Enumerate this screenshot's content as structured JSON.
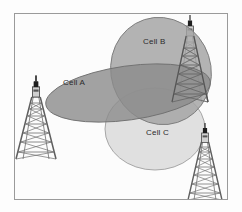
{
  "figure": {
    "background_color": "#fdfdfd",
    "frame_color": "#9a9a9a",
    "label_color": "#2b2b2b"
  },
  "cells": [
    {
      "id": "cell-a",
      "label": "Cell A",
      "fill": "#8e8e8e",
      "stroke": "#6f6f6f",
      "cx": 128,
      "cy": 93,
      "rx": 83,
      "ry": 27,
      "rotate": -8,
      "label_x": 63,
      "label_y": 79
    },
    {
      "id": "cell-b",
      "label": "Cell B",
      "fill": "#a6a6a6",
      "stroke": "#7d7d7d",
      "cx": 161,
      "cy": 71,
      "rx": 50,
      "ry": 54,
      "rotate": -18,
      "label_x": 143,
      "label_y": 38
    },
    {
      "id": "cell-c",
      "label": "Cell C",
      "fill": "#dcdcdc",
      "stroke": "#9e9e9e",
      "cx": 155,
      "cy": 129,
      "rx": 50,
      "ry": 41,
      "rotate": 0,
      "label_x": 146,
      "label_y": 129
    }
  ],
  "towers": [
    {
      "id": "tower-left",
      "x": 36,
      "y": 87,
      "height": 72,
      "base_half": 20
    },
    {
      "id": "tower-top-right",
      "x": 190,
      "y": 24,
      "height": 78,
      "base_half": 18
    },
    {
      "id": "tower-bottom-right",
      "x": 205,
      "y": 133,
      "height": 67,
      "base_half": 17
    }
  ],
  "colors": {
    "cell_a": "#8e8e8e",
    "cell_b": "#a6a6a6",
    "cell_c": "#dcdcdc",
    "tower": "#6b6b6b",
    "tower_dark": "#2a2a2a",
    "frame": "#9a9a9a"
  }
}
